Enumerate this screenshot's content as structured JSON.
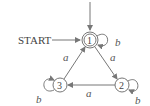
{
  "diagram": {
    "type": "finite-automaton",
    "start_label": "START",
    "states": [
      {
        "id": "1",
        "label": "1",
        "accepting": true,
        "start": true
      },
      {
        "id": "2",
        "label": "2",
        "accepting": false
      },
      {
        "id": "3",
        "label": "3",
        "accepting": false
      }
    ],
    "transitions": [
      {
        "from": "1",
        "to": "1",
        "label": "b"
      },
      {
        "from": "1",
        "to": "2",
        "label": "a"
      },
      {
        "from": "2",
        "to": "2",
        "label": "b"
      },
      {
        "from": "2",
        "to": "3",
        "label": "a"
      },
      {
        "from": "3",
        "to": "3",
        "label": "b"
      },
      {
        "from": "3",
        "to": "1",
        "label": "a"
      }
    ],
    "colors": {
      "stroke": "#777777",
      "text": "#444444"
    }
  }
}
